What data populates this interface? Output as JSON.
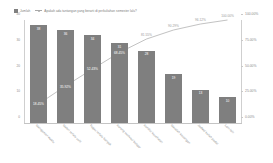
{
  "legend": {
    "items": [
      {
        "marker": "square-swatch",
        "label": "Jumlah"
      },
      {
        "marker": "line-marker",
        "label": "Apakah ada tantangan yang berarti di perkuliahan semester lalu?"
      }
    ]
  },
  "chart_data": {
    "type": "bar",
    "title": "Apakah ada tantangan yang berarti di perkuliahan semester lalu?",
    "xlabel": "",
    "ylabel": "",
    "ylim": [
      0,
      40
    ],
    "y2lim": [
      0,
      100
    ],
    "grid": false,
    "legend_position": "top-left",
    "categories": [
      "Manajemen waktu",
      "Materi terlalu sulit",
      "Tugas terlalu banyak",
      "Kurang motivasi belajar",
      "Kondisi kesehatan",
      "Masalah keuangan",
      "Jadwal kuliah padat",
      "Lain-lain"
    ],
    "series": [
      {
        "name": "Jumlah",
        "type": "bar",
        "values": [
          38,
          36,
          34,
          31,
          28,
          19,
          13,
          10
        ]
      },
      {
        "name": "Apakah ada tantangan yang berarti di perkuliahan semester lalu?",
        "type": "line",
        "axis": "secondary",
        "values": [
          18.45,
          35.92,
          52.43,
          68.45,
          81.55,
          90.29,
          96.12,
          100.0
        ],
        "value_labels": [
          "18.45%",
          "35.92%",
          "52.43%",
          "68.45%",
          "81.55%",
          "90.29%",
          "96.12%",
          "100.00%"
        ]
      }
    ],
    "yticks": [
      "40",
      "30",
      "20",
      "10",
      "0"
    ],
    "y2ticks": [
      "100.00%",
      "75.00%",
      "50.00%",
      "25.00%",
      "0.00%"
    ]
  },
  "colors": {
    "bar": "#7f7f7f",
    "line": "#a8a8a8",
    "axis": "#c4c4c4",
    "text": "#8a8a8a",
    "bar_label_text": "#ffffff",
    "background": "#ffffff"
  }
}
